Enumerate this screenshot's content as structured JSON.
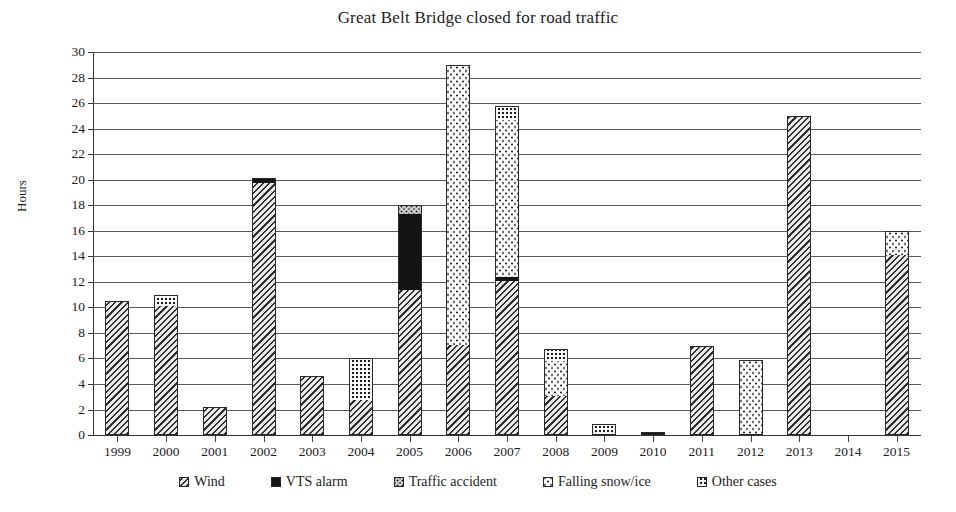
{
  "chart_data": {
    "type": "bar",
    "stacked": true,
    "title": "Great Belt Bridge closed for road traffic",
    "xlabel": "",
    "ylabel": "Hours",
    "ylim": [
      0,
      30
    ],
    "ytick_step": 2,
    "yticks": [
      0,
      2,
      4,
      6,
      8,
      10,
      12,
      14,
      16,
      18,
      20,
      22,
      24,
      26,
      28,
      30
    ],
    "grid": true,
    "legend_position": "bottom",
    "categories": [
      "1999",
      "2000",
      "2001",
      "2002",
      "2003",
      "2004",
      "2005",
      "2006",
      "2007",
      "2008",
      "2009",
      "2010",
      "2011",
      "2012",
      "2013",
      "2014",
      "2015"
    ],
    "series": [
      {
        "name": "Wind",
        "pattern": "diagonal-hatch",
        "values": [
          10.5,
          10.0,
          2.2,
          19.7,
          4.6,
          2.7,
          11.3,
          7.0,
          12.0,
          3.0,
          0.0,
          0.0,
          7.0,
          0.0,
          25.0,
          0.0,
          14.0
        ]
      },
      {
        "name": "VTS alarm",
        "pattern": "solid-black",
        "values": [
          0,
          0,
          0,
          0.4,
          0,
          0,
          5.9,
          0,
          0.3,
          0,
          0,
          0.2,
          0,
          0,
          0,
          0,
          0
        ]
      },
      {
        "name": "Traffic accident",
        "pattern": "dense-dots",
        "values": [
          0,
          0,
          0,
          0,
          0,
          0,
          0.8,
          0,
          0,
          0,
          0,
          0,
          0,
          0,
          0,
          0,
          0
        ]
      },
      {
        "name": "Falling snow/ice",
        "pattern": "sparse-dots",
        "values": [
          0,
          0,
          0,
          0,
          0,
          0,
          0,
          22.0,
          12.3,
          2.7,
          0,
          0,
          0,
          5.9,
          0,
          0,
          2.0
        ]
      },
      {
        "name": "Other cases",
        "pattern": "checker",
        "values": [
          0,
          1.0,
          0,
          0,
          0,
          3.3,
          0,
          0,
          1.2,
          1.0,
          0.9,
          0,
          0,
          0,
          0,
          0,
          0
        ]
      }
    ],
    "totals": [
      10.5,
      11.0,
      2.2,
      20.1,
      4.6,
      6.0,
      18.0,
      29.0,
      25.8,
      6.7,
      0.9,
      0.2,
      7.0,
      5.9,
      25.0,
      0.0,
      16.0
    ]
  },
  "legend": {
    "items": [
      {
        "label": "Wind",
        "pattern": "diagonal-hatch"
      },
      {
        "label": "VTS alarm",
        "pattern": "solid-black"
      },
      {
        "label": "Traffic accident",
        "pattern": "dense-dots"
      },
      {
        "label": "Falling snow/ice",
        "pattern": "sparse-dots"
      },
      {
        "label": "Other cases",
        "pattern": "checker"
      }
    ]
  },
  "colors": {
    "axis": "#333333",
    "grid": "#5a5a5a",
    "text": "#1c1c1c",
    "ink": "#141414",
    "paper": "#ffffff"
  }
}
